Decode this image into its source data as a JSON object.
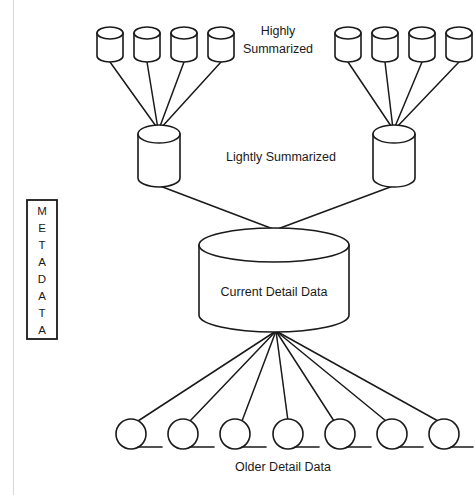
{
  "diagram": {
    "background_color": "#ffffff",
    "stroke_color": "#1a1a1a",
    "labels": {
      "highly_summarized_line1": "Highly",
      "highly_summarized_line2": "Summarized",
      "lightly_summarized": "Lightly Summarized",
      "current_detail_data": "Current Detail Data",
      "older_detail_data": "Older Detail Data"
    },
    "metadata_box": {
      "text": "METADATA",
      "letters": [
        "M",
        "E",
        "T",
        "A",
        "D",
        "A",
        "T",
        "A"
      ],
      "orientation": "vertical"
    },
    "tiers": [
      {
        "name": "highly-summarized",
        "label": "Highly Summarized",
        "shape": "cylinder",
        "count": 8,
        "groups": 2,
        "per_group": 4
      },
      {
        "name": "lightly-summarized",
        "label": "Lightly Summarized",
        "shape": "cylinder",
        "count": 2
      },
      {
        "name": "current-detail",
        "label": "Current Detail Data",
        "shape": "cylinder",
        "count": 1
      },
      {
        "name": "older-detail",
        "label": "Older Detail Data",
        "shape": "tape-reel",
        "count": 7
      }
    ],
    "geometry": {
      "top_cylinders_left": [
        {
          "cx": 110,
          "cy": 44
        },
        {
          "cx": 147,
          "cy": 44
        },
        {
          "cx": 184,
          "cy": 44
        },
        {
          "cx": 221,
          "cy": 44
        }
      ],
      "top_cylinders_right": [
        {
          "cx": 348,
          "cy": 44
        },
        {
          "cx": 385,
          "cy": 44
        },
        {
          "cx": 422,
          "cy": 44
        },
        {
          "cx": 459,
          "cy": 44
        }
      ],
      "mid_cylinders": [
        {
          "cx": 159,
          "cy": 157
        },
        {
          "cx": 394,
          "cy": 157
        }
      ],
      "center_cylinder": {
        "cx": 274,
        "cy": 282
      },
      "bottom_reels": [
        {
          "cx": 131,
          "cy": 434
        },
        {
          "cx": 183,
          "cy": 434
        },
        {
          "cx": 235,
          "cy": 434
        },
        {
          "cx": 288,
          "cy": 434
        },
        {
          "cx": 340,
          "cy": 434
        },
        {
          "cx": 392,
          "cy": 434
        },
        {
          "cx": 444,
          "cy": 434
        }
      ],
      "metadata_box": {
        "x": 27,
        "y": 200,
        "w": 30,
        "h": 139
      }
    }
  }
}
